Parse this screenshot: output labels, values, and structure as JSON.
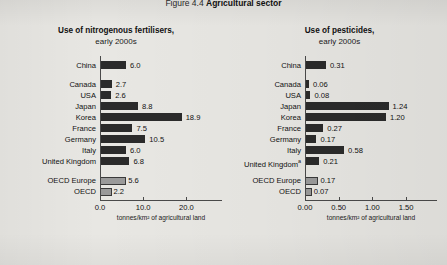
{
  "figure": {
    "number": "Figure 4.4",
    "name": "Agricultural sector"
  },
  "panels": {
    "left": {
      "title": "Use of nitrogenous fertilisers,",
      "subtitle": "early 2000s",
      "axis_caption": "tonnes/km² of agricultural land"
    },
    "right": {
      "title": "Use of pesticides,",
      "subtitle": "early 2000s",
      "axis_caption": "tonnes/km² of agricultural land"
    }
  },
  "chart_data": [
    {
      "type": "bar",
      "orientation": "horizontal",
      "title": "Use of nitrogenous fertilisers, early 2000s",
      "xlabel": "tonnes/km² of agricultural land",
      "ylabel": "",
      "xlim": [
        0.0,
        25.0
      ],
      "grid": false,
      "legend": "none",
      "tick_labels": [
        "0.0",
        "10.0",
        "20.0"
      ],
      "ticks": [
        0.0,
        10.0,
        20.0
      ],
      "categories": [
        "China",
        "Canada",
        "USA",
        "Japan",
        "Korea",
        "France",
        "Germany",
        "Italy",
        "United Kingdom",
        "OECD Europe",
        "OECD"
      ],
      "values": [
        6.0,
        2.7,
        2.6,
        8.8,
        18.9,
        7.5,
        10.5,
        6.0,
        6.8,
        5.6,
        2.2
      ],
      "value_labels": [
        "6.0",
        "2.7",
        "2.6",
        "8.8",
        "18.9",
        "7.5",
        "10.5",
        "6.0",
        "6.8",
        "5.6",
        "2.2"
      ],
      "groups": [
        {
          "name": "non-member",
          "categories": [
            "China"
          ],
          "style": "dark"
        },
        {
          "name": "countries",
          "categories": [
            "Canada",
            "USA",
            "Japan",
            "Korea",
            "France",
            "Germany",
            "Italy",
            "United Kingdom"
          ],
          "style": "dark"
        },
        {
          "name": "aggregates",
          "categories": [
            "OECD Europe",
            "OECD"
          ],
          "style": "light"
        }
      ]
    },
    {
      "type": "bar",
      "orientation": "horizontal",
      "title": "Use of pesticides, early 2000s",
      "xlabel": "tonnes/km² of agricultural land",
      "ylabel": "",
      "xlim": [
        0.0,
        1.75
      ],
      "grid": false,
      "legend": "none",
      "tick_labels": [
        "0.00",
        "0.50",
        "1.00",
        "1.50"
      ],
      "ticks": [
        0.0,
        0.5,
        1.0,
        1.5
      ],
      "categories": [
        "China",
        "Canada",
        "USA",
        "Japan",
        "Korea",
        "France",
        "Germany",
        "Italy",
        "United Kingdom",
        "OECD Europe",
        "OECD"
      ],
      "category_notes": {
        "United Kingdom": "a"
      },
      "values": [
        0.31,
        0.06,
        0.08,
        1.24,
        1.2,
        0.27,
        0.17,
        0.58,
        0.21,
        0.17,
        0.07
      ],
      "value_labels": [
        "0.31",
        "0.06",
        "0.08",
        "1.24",
        "1.20",
        "0.27",
        "0.17",
        "0.58",
        "0.21",
        "0.17",
        "0.07"
      ],
      "groups": [
        {
          "name": "non-member",
          "categories": [
            "China"
          ],
          "style": "dark"
        },
        {
          "name": "countries",
          "categories": [
            "Canada",
            "USA",
            "Japan",
            "Korea",
            "France",
            "Germany",
            "Italy",
            "United Kingdom"
          ],
          "style": "dark"
        },
        {
          "name": "aggregates",
          "categories": [
            "OECD Europe",
            "OECD"
          ],
          "style": "light"
        }
      ]
    }
  ],
  "colors": {
    "background": "#e8e7e3",
    "bar_dark": "#2b2b2b",
    "bar_light": "#9a9a9a",
    "axis": "#4a4a4a",
    "text": "#111111"
  }
}
